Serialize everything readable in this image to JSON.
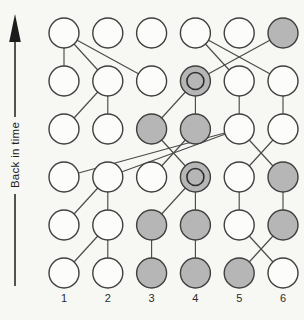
{
  "diagram": {
    "axis_label": "Back in time",
    "column_labels": [
      "1",
      "2",
      "3",
      "4",
      "5",
      "6"
    ],
    "rows": 6,
    "columns": 6,
    "node_states": {
      "shaded_nodes": [
        "r1c6",
        "r2c4",
        "r3c3",
        "r3c4",
        "r4c4",
        "r4c6",
        "r5c3",
        "r5c4",
        "r5c6",
        "r6c3",
        "r6c4",
        "r6c5"
      ],
      "ring_nodes": [
        "r2c4",
        "r4c4"
      ]
    },
    "edges": [
      [
        "r1c1",
        "r2c1"
      ],
      [
        "r1c1",
        "r2c2"
      ],
      [
        "r1c1",
        "r2c3"
      ],
      [
        "r1c6",
        "r2c4"
      ],
      [
        "r1c4",
        "r2c5"
      ],
      [
        "r1c4",
        "r2c6"
      ],
      [
        "r2c2",
        "r3c1"
      ],
      [
        "r2c2",
        "r3c2"
      ],
      [
        "r2c4",
        "r3c3"
      ],
      [
        "r2c4",
        "r3c4"
      ],
      [
        "r2c5",
        "r3c5"
      ],
      [
        "r2c6",
        "r3c6"
      ],
      [
        "r3c5",
        "r4c1"
      ],
      [
        "r3c5",
        "r4c2"
      ],
      [
        "r3c4",
        "r4c3"
      ],
      [
        "r3c3",
        "r4c4"
      ],
      [
        "r3c6",
        "r4c5"
      ],
      [
        "r3c5",
        "r4c6"
      ],
      [
        "r4c2",
        "r5c1"
      ],
      [
        "r4c2",
        "r5c2"
      ],
      [
        "r4c4",
        "r5c3"
      ],
      [
        "r4c4",
        "r5c4"
      ],
      [
        "r4c5",
        "r5c5"
      ],
      [
        "r4c6",
        "r5c6"
      ],
      [
        "r5c2",
        "r6c1"
      ],
      [
        "r5c2",
        "r6c2"
      ],
      [
        "r5c3",
        "r6c3"
      ],
      [
        "r5c4",
        "r6c4"
      ],
      [
        "r5c6",
        "r6c5"
      ],
      [
        "r5c5",
        "r6c6"
      ]
    ],
    "colors": {
      "background": "#f7f7f4",
      "node_fill_open": "#fcfcfa",
      "node_fill_shaded": "#b6b6b6",
      "node_stroke": "#3f3f3f",
      "edge_stroke": "#4a4a4a",
      "arrow_color": "#1c1c1c",
      "label_color": "#2b2b2b"
    }
  }
}
